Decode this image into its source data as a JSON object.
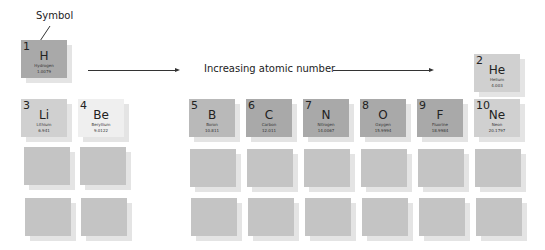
{
  "annotation": {
    "symbol_label": "Symbol"
  },
  "heading": {
    "text": "Increasing atomic number"
  },
  "colors": {
    "dark_tile": "#a9a9a9",
    "medium_tile": "#b9b9b9",
    "light_tile": "#d0d0d0",
    "pale_tile": "#efefef",
    "blank_tile": "#c4c4c4"
  },
  "elements": [
    {
      "number": "1",
      "symbol": "H",
      "name": "Hydrogen",
      "mass": "1.0079"
    },
    {
      "number": "2",
      "symbol": "He",
      "name": "Helium",
      "mass": "4.003"
    },
    {
      "number": "3",
      "symbol": "Li",
      "name": "Lithium",
      "mass": "6.941"
    },
    {
      "number": "4",
      "symbol": "Be",
      "name": "Beryllium",
      "mass": "9.0122"
    },
    {
      "number": "5",
      "symbol": "B",
      "name": "Boron",
      "mass": "10.811"
    },
    {
      "number": "6",
      "symbol": "C",
      "name": "Carbon",
      "mass": "12.011"
    },
    {
      "number": "7",
      "symbol": "N",
      "name": "Nitrogen",
      "mass": "14.0067"
    },
    {
      "number": "8",
      "symbol": "O",
      "name": "Oxygen",
      "mass": "15.9994"
    },
    {
      "number": "9",
      "symbol": "F",
      "name": "Fluorine",
      "mass": "18.9984"
    },
    {
      "number": "10",
      "symbol": "Ne",
      "name": "Neon",
      "mass": "20.1797"
    }
  ]
}
